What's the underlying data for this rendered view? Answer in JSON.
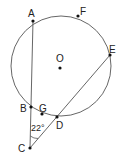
{
  "diagram": {
    "labels": {
      "A": "A",
      "B": "B",
      "C": "C",
      "D": "D",
      "E": "E",
      "F": "F",
      "G": "G",
      "O": "O"
    },
    "angle_label": "22°",
    "colors": {
      "stroke": "#444444",
      "point": "#111111"
    }
  }
}
